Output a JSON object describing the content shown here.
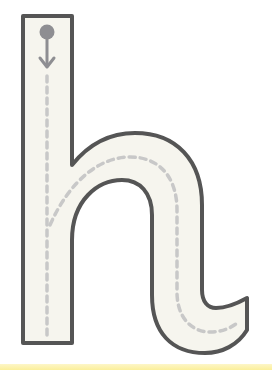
{
  "worksheet": {
    "letter": "h",
    "title": "Letter h tracing guide",
    "colors": {
      "background": "#ffffff",
      "letter_fill": "#f6f5ee",
      "outline": "#555555",
      "guide_dash": "#c8c8c8",
      "start_marker": "#8e8e92",
      "bottom_strip": "#fbef9a"
    },
    "icons": {
      "start_marker": "start-dot-icon",
      "direction": "arrow-down-icon"
    }
  }
}
